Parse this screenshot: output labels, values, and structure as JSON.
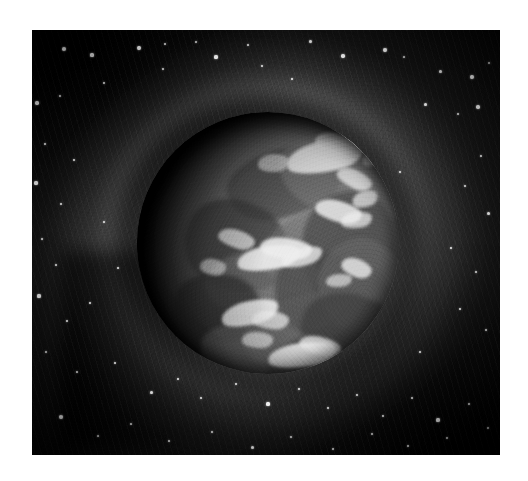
{
  "page": {
    "background_color": "#ffffff",
    "width": 528,
    "height": 481
  },
  "artwork": {
    "title": "Planet surrounded by a swirling nebula vortex",
    "medium": "grayscale painting / printed plate",
    "plate": {
      "left": 32,
      "top": 30,
      "width": 468,
      "height": 425,
      "border_color": "#0a0a0a"
    },
    "palette": {
      "deep_space": "#090909",
      "mid_space": "#1d1d1d",
      "nebula_arc": "#6e6e6e",
      "planet_lit": "#8a8a8a",
      "planet_shadow": "#0b0b0b",
      "highlight": "#e9e9e9",
      "star": "#ffffff"
    },
    "planet": {
      "label": "planet",
      "center_x": 268,
      "center_y": 243,
      "radius": 131,
      "lit_from": "lower-right",
      "terminator_side": "upper-left"
    },
    "nebula": {
      "label": "swirling nebula vortex",
      "ring_count": 3,
      "rotation_direction": "counter-clockwise"
    },
    "stars": [
      {
        "x": 64,
        "y": 49,
        "r": 2.2
      },
      {
        "x": 92,
        "y": 55,
        "r": 1.6
      },
      {
        "x": 139,
        "y": 48,
        "r": 1.9
      },
      {
        "x": 165,
        "y": 44,
        "r": 1.4
      },
      {
        "x": 196,
        "y": 42,
        "r": 1.2
      },
      {
        "x": 216,
        "y": 57,
        "r": 1.6
      },
      {
        "x": 248,
        "y": 45,
        "r": 1.3
      },
      {
        "x": 310,
        "y": 41,
        "r": 1.5
      },
      {
        "x": 343,
        "y": 56,
        "r": 1.7
      },
      {
        "x": 385,
        "y": 50,
        "r": 2.3
      },
      {
        "x": 404,
        "y": 57,
        "r": 1.2
      },
      {
        "x": 440,
        "y": 71,
        "r": 1.5
      },
      {
        "x": 472,
        "y": 77,
        "r": 2.0
      },
      {
        "x": 489,
        "y": 63,
        "r": 1.3
      },
      {
        "x": 37,
        "y": 103,
        "r": 1.7
      },
      {
        "x": 60,
        "y": 96,
        "r": 1.1
      },
      {
        "x": 104,
        "y": 83,
        "r": 1.2
      },
      {
        "x": 163,
        "y": 69,
        "r": 1.1
      },
      {
        "x": 262,
        "y": 66,
        "r": 1.2
      },
      {
        "x": 292,
        "y": 79,
        "r": 1.3
      },
      {
        "x": 425,
        "y": 104,
        "r": 1.5
      },
      {
        "x": 458,
        "y": 114,
        "r": 1.2
      },
      {
        "x": 478,
        "y": 107,
        "r": 1.8
      },
      {
        "x": 45,
        "y": 144,
        "r": 1.4
      },
      {
        "x": 74,
        "y": 160,
        "r": 1.2
      },
      {
        "x": 36,
        "y": 183,
        "r": 1.6
      },
      {
        "x": 61,
        "y": 204,
        "r": 1.2
      },
      {
        "x": 481,
        "y": 156,
        "r": 1.4
      },
      {
        "x": 465,
        "y": 186,
        "r": 1.2
      },
      {
        "x": 488,
        "y": 213,
        "r": 1.5
      },
      {
        "x": 42,
        "y": 239,
        "r": 1.2
      },
      {
        "x": 56,
        "y": 265,
        "r": 1.1
      },
      {
        "x": 451,
        "y": 248,
        "r": 1.3
      },
      {
        "x": 476,
        "y": 272,
        "r": 1.2
      },
      {
        "x": 39,
        "y": 296,
        "r": 1.6
      },
      {
        "x": 67,
        "y": 321,
        "r": 1.3
      },
      {
        "x": 90,
        "y": 303,
        "r": 1.1
      },
      {
        "x": 460,
        "y": 309,
        "r": 1.4
      },
      {
        "x": 486,
        "y": 330,
        "r": 1.2
      },
      {
        "x": 46,
        "y": 352,
        "r": 1.3
      },
      {
        "x": 77,
        "y": 372,
        "r": 1.2
      },
      {
        "x": 115,
        "y": 363,
        "r": 1.4
      },
      {
        "x": 151,
        "y": 392,
        "r": 1.5
      },
      {
        "x": 178,
        "y": 379,
        "r": 1.2
      },
      {
        "x": 201,
        "y": 398,
        "r": 1.3
      },
      {
        "x": 236,
        "y": 384,
        "r": 1.1
      },
      {
        "x": 268,
        "y": 404,
        "r": 1.6
      },
      {
        "x": 299,
        "y": 389,
        "r": 1.2
      },
      {
        "x": 328,
        "y": 408,
        "r": 1.3
      },
      {
        "x": 357,
        "y": 395,
        "r": 1.1
      },
      {
        "x": 383,
        "y": 416,
        "r": 1.4
      },
      {
        "x": 412,
        "y": 398,
        "r": 1.2
      },
      {
        "x": 438,
        "y": 420,
        "r": 1.6
      },
      {
        "x": 469,
        "y": 404,
        "r": 1.3
      },
      {
        "x": 488,
        "y": 428,
        "r": 1.2
      },
      {
        "x": 61,
        "y": 417,
        "r": 2.0
      },
      {
        "x": 98,
        "y": 436,
        "r": 1.3
      },
      {
        "x": 131,
        "y": 424,
        "r": 1.2
      },
      {
        "x": 169,
        "y": 441,
        "r": 1.4
      },
      {
        "x": 212,
        "y": 432,
        "r": 1.2
      },
      {
        "x": 252,
        "y": 447,
        "r": 1.5
      },
      {
        "x": 291,
        "y": 437,
        "r": 1.1
      },
      {
        "x": 333,
        "y": 449,
        "r": 1.3
      },
      {
        "x": 372,
        "y": 434,
        "r": 1.2
      },
      {
        "x": 408,
        "y": 446,
        "r": 1.4
      },
      {
        "x": 447,
        "y": 438,
        "r": 1.2
      },
      {
        "x": 118,
        "y": 268,
        "r": 1.1
      },
      {
        "x": 104,
        "y": 222,
        "r": 1.0
      },
      {
        "x": 420,
        "y": 352,
        "r": 1.1
      },
      {
        "x": 400,
        "y": 172,
        "r": 1.0
      }
    ],
    "surface_blotches": [
      {
        "x": 34,
        "y": 14,
        "w": 44,
        "h": 26,
        "rot": -14,
        "color": "#4d4d4d",
        "opacity": 0.75
      },
      {
        "x": 54,
        "y": 10,
        "w": 58,
        "h": 30,
        "rot": 12,
        "color": "#787878",
        "opacity": 0.7
      },
      {
        "x": 18,
        "y": 34,
        "w": 40,
        "h": 34,
        "rot": 26,
        "color": "#3f3f3f",
        "opacity": 0.72
      },
      {
        "x": 46,
        "y": 36,
        "w": 52,
        "h": 28,
        "rot": -20,
        "color": "#6e6e6e",
        "opacity": 0.62
      },
      {
        "x": 63,
        "y": 30,
        "w": 36,
        "h": 42,
        "rot": 8,
        "color": "#484848",
        "opacity": 0.66
      },
      {
        "x": 26,
        "y": 52,
        "w": 44,
        "h": 24,
        "rot": -8,
        "color": "#7b7b7b",
        "opacity": 0.55
      },
      {
        "x": 52,
        "y": 55,
        "w": 48,
        "h": 32,
        "rot": 18,
        "color": "#454545",
        "opacity": 0.64
      },
      {
        "x": 70,
        "y": 48,
        "w": 34,
        "h": 38,
        "rot": -26,
        "color": "#6a6a6a",
        "opacity": 0.58
      },
      {
        "x": 14,
        "y": 62,
        "w": 34,
        "h": 26,
        "rot": 10,
        "color": "#333333",
        "opacity": 0.7
      },
      {
        "x": 40,
        "y": 70,
        "w": 50,
        "h": 26,
        "rot": -16,
        "color": "#5e5e5e",
        "opacity": 0.6
      },
      {
        "x": 62,
        "y": 70,
        "w": 40,
        "h": 32,
        "rot": 22,
        "color": "#3c3c3c",
        "opacity": 0.62
      },
      {
        "x": 24,
        "y": 80,
        "w": 46,
        "h": 24,
        "rot": 6,
        "color": "#6f6f6f",
        "opacity": 0.52
      },
      {
        "x": 50,
        "y": 84,
        "w": 42,
        "h": 22,
        "rot": -12,
        "color": "#454545",
        "opacity": 0.6
      }
    ],
    "surface_highlights": [
      {
        "x": 57,
        "y": 11,
        "w": 30,
        "h": 12,
        "rot": -12,
        "opacity": 0.95
      },
      {
        "x": 68,
        "y": 8,
        "w": 16,
        "h": 8,
        "rot": 10,
        "opacity": 0.8
      },
      {
        "x": 46,
        "y": 16,
        "w": 12,
        "h": 7,
        "rot": -4,
        "opacity": 0.62
      },
      {
        "x": 76,
        "y": 22,
        "w": 14,
        "h": 7,
        "rot": 24,
        "opacity": 0.82
      },
      {
        "x": 82,
        "y": 30,
        "w": 10,
        "h": 6,
        "rot": -18,
        "opacity": 0.7
      },
      {
        "x": 68,
        "y": 34,
        "w": 18,
        "h": 8,
        "rot": 14,
        "opacity": 0.85
      },
      {
        "x": 78,
        "y": 38,
        "w": 12,
        "h": 6,
        "rot": -8,
        "opacity": 0.72
      },
      {
        "x": 31,
        "y": 45,
        "w": 14,
        "h": 7,
        "rot": 16,
        "opacity": 0.74
      },
      {
        "x": 38,
        "y": 51,
        "w": 24,
        "h": 9,
        "rot": -10,
        "opacity": 0.92
      },
      {
        "x": 47,
        "y": 48,
        "w": 20,
        "h": 8,
        "rot": 6,
        "opacity": 0.88
      },
      {
        "x": 55,
        "y": 52,
        "w": 16,
        "h": 7,
        "rot": -16,
        "opacity": 0.78
      },
      {
        "x": 24,
        "y": 56,
        "w": 10,
        "h": 6,
        "rot": 8,
        "opacity": 0.6
      },
      {
        "x": 32,
        "y": 72,
        "w": 22,
        "h": 9,
        "rot": -14,
        "opacity": 0.86
      },
      {
        "x": 44,
        "y": 76,
        "w": 14,
        "h": 7,
        "rot": 4,
        "opacity": 0.7
      },
      {
        "x": 78,
        "y": 56,
        "w": 12,
        "h": 7,
        "rot": 20,
        "opacity": 0.8
      },
      {
        "x": 72,
        "y": 62,
        "w": 10,
        "h": 5,
        "rot": -6,
        "opacity": 0.64
      },
      {
        "x": 50,
        "y": 88,
        "w": 26,
        "h": 9,
        "rot": -8,
        "opacity": 0.88
      },
      {
        "x": 62,
        "y": 86,
        "w": 16,
        "h": 7,
        "rot": 12,
        "opacity": 0.75
      },
      {
        "x": 40,
        "y": 84,
        "w": 12,
        "h": 6,
        "rot": 2,
        "opacity": 0.66
      },
      {
        "x": 86,
        "y": 14,
        "w": 10,
        "h": 6,
        "rot": -22,
        "opacity": 0.68
      }
    ]
  }
}
